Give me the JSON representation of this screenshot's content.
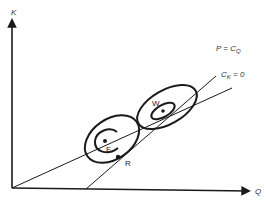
{
  "diagram": {
    "axes": {
      "y_label": "K",
      "x_label": "Q"
    },
    "lines": {
      "price_line_label": "P = C",
      "price_line_sub": "Q",
      "cost_line_label": "C",
      "cost_line_sub": "K",
      "cost_line_suffix": " = 0"
    },
    "points": {
      "F": "F",
      "W": "W",
      "R": "R"
    },
    "colors": {
      "stroke": "#1a1a1a",
      "background": "#ffffff"
    }
  }
}
